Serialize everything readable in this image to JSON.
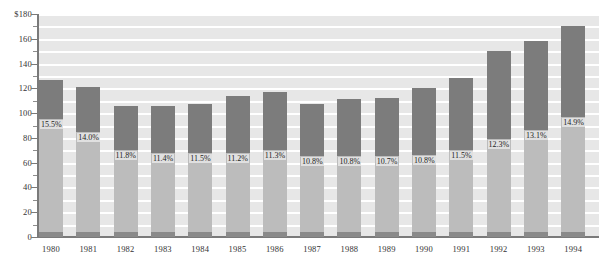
{
  "chart_data": {
    "type": "bar",
    "subtype": "stacked-column",
    "title": "",
    "xlabel": "",
    "ylabel": "",
    "ylim": [
      0,
      180
    ],
    "ytick_labels": [
      "$180",
      "160",
      "140",
      "120",
      "100",
      "80",
      "60",
      "40",
      "20",
      "0"
    ],
    "ytick_values": [
      180,
      160,
      140,
      120,
      100,
      80,
      60,
      40,
      20,
      0
    ],
    "minor_tick_interval": 10,
    "grid": true,
    "legend": "none",
    "categories": [
      "1980",
      "1981",
      "1982",
      "1983",
      "1984",
      "1985",
      "1986",
      "1987",
      "1988",
      "1989",
      "1990",
      "1991",
      "1992",
      "1993",
      "1994"
    ],
    "series": [
      {
        "name": "lower-segment",
        "color": "#bcbcbc",
        "values": [
          95,
          85,
          70,
          68,
          68,
          68,
          70,
          65,
          65,
          65,
          66,
          70,
          79,
          86,
          97
        ]
      },
      {
        "name": "upper-segment",
        "color": "#7c7c7c",
        "values": [
          32,
          36,
          36,
          38,
          39,
          46,
          47,
          42,
          46,
          47,
          54,
          58,
          71,
          72,
          73
        ]
      }
    ],
    "totals": [
      127,
      121,
      106,
      106,
      107,
      114,
      117,
      107,
      111,
      112,
      120,
      128,
      150,
      158,
      170
    ],
    "data_labels": [
      "15.5%",
      "14.0%",
      "11.8%",
      "11.4%",
      "11.5%",
      "11.2%",
      "11.3%",
      "10.8%",
      "10.8%",
      "10.7%",
      "10.8%",
      "11.5%",
      "12.3%",
      "13.1%",
      "14.9%"
    ]
  },
  "colors": {
    "upper_segment": "#7c7c7c",
    "lower_segment": "#bcbcbc",
    "plot_background": "#e7e7e7",
    "gridline": "#ffffff",
    "axis": "#7a7a7a",
    "text": "#333333"
  }
}
